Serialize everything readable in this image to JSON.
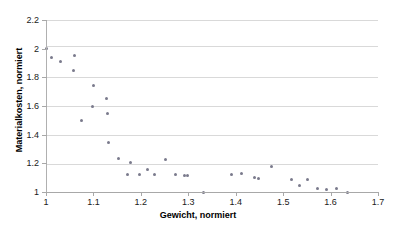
{
  "chart_data": {
    "type": "scatter",
    "title": "",
    "xlabel": "Gewicht, normiert",
    "ylabel": "Materialkosten, normiert",
    "xlim": [
      1.0,
      1.7
    ],
    "ylim": [
      1.0,
      2.2
    ],
    "xticks": [
      "1",
      "1.1",
      "1.2",
      "1.3",
      "1.4",
      "1.5",
      "1.6",
      "1.7"
    ],
    "xtick_values": [
      1.0,
      1.1,
      1.2,
      1.3,
      1.4,
      1.5,
      1.6,
      1.7
    ],
    "yticks": [
      "1",
      "1.2",
      "1.4",
      "1.6",
      "1.8",
      "2",
      "2.2"
    ],
    "ytick_values": [
      1.0,
      1.2,
      1.4,
      1.6,
      1.8,
      2.0,
      2.2
    ],
    "grid": "horizontal",
    "legend": null,
    "marker_color": "#7a7a8c",
    "gridline_color": "#d9d9d9",
    "axis_color": "#a8a8a8",
    "series": [
      {
        "name": "Varianten",
        "points": [
          [
            1.0,
            2.0
          ],
          [
            1.012,
            1.94
          ],
          [
            1.03,
            1.91
          ],
          [
            1.06,
            1.95
          ],
          [
            1.058,
            1.848
          ],
          [
            1.075,
            1.5
          ],
          [
            1.098,
            1.6
          ],
          [
            1.1,
            1.745
          ],
          [
            1.128,
            1.655
          ],
          [
            1.13,
            1.548
          ],
          [
            1.132,
            1.342
          ],
          [
            1.152,
            1.232
          ],
          [
            1.172,
            1.125
          ],
          [
            1.178,
            1.205
          ],
          [
            1.198,
            1.125
          ],
          [
            1.215,
            1.155
          ],
          [
            1.228,
            1.125
          ],
          [
            1.252,
            1.23
          ],
          [
            1.272,
            1.12
          ],
          [
            1.292,
            1.112
          ],
          [
            1.298,
            1.115
          ],
          [
            1.332,
            1.0
          ],
          [
            1.392,
            1.125
          ],
          [
            1.412,
            1.132
          ],
          [
            1.44,
            1.098
          ],
          [
            1.448,
            1.092
          ],
          [
            1.475,
            1.178
          ],
          [
            1.518,
            1.088
          ],
          [
            1.535,
            1.048
          ],
          [
            1.552,
            1.088
          ],
          [
            1.572,
            1.025
          ],
          [
            1.592,
            1.02
          ],
          [
            1.612,
            1.025
          ],
          [
            1.635,
            1.0
          ]
        ]
      }
    ]
  }
}
